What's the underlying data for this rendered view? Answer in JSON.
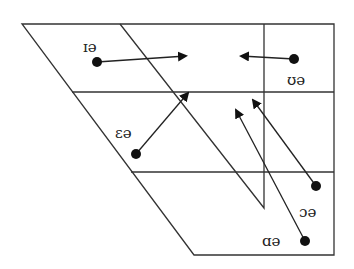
{
  "diagram": {
    "type": "vowel-quadrilateral",
    "colors": {
      "line": "#333333",
      "point": "#111111",
      "background": "#ffffff"
    },
    "diphthongs": [
      {
        "label": "ɪə",
        "from": "front-close",
        "to": "central"
      },
      {
        "label": "ʊə",
        "from": "back-close",
        "to": "central"
      },
      {
        "label": "ɛə",
        "from": "front-mid",
        "to": "central"
      },
      {
        "label": "ɔə",
        "from": "back-mid",
        "to": "central"
      },
      {
        "label": "ɑə",
        "from": "back-open",
        "to": "central"
      }
    ]
  }
}
